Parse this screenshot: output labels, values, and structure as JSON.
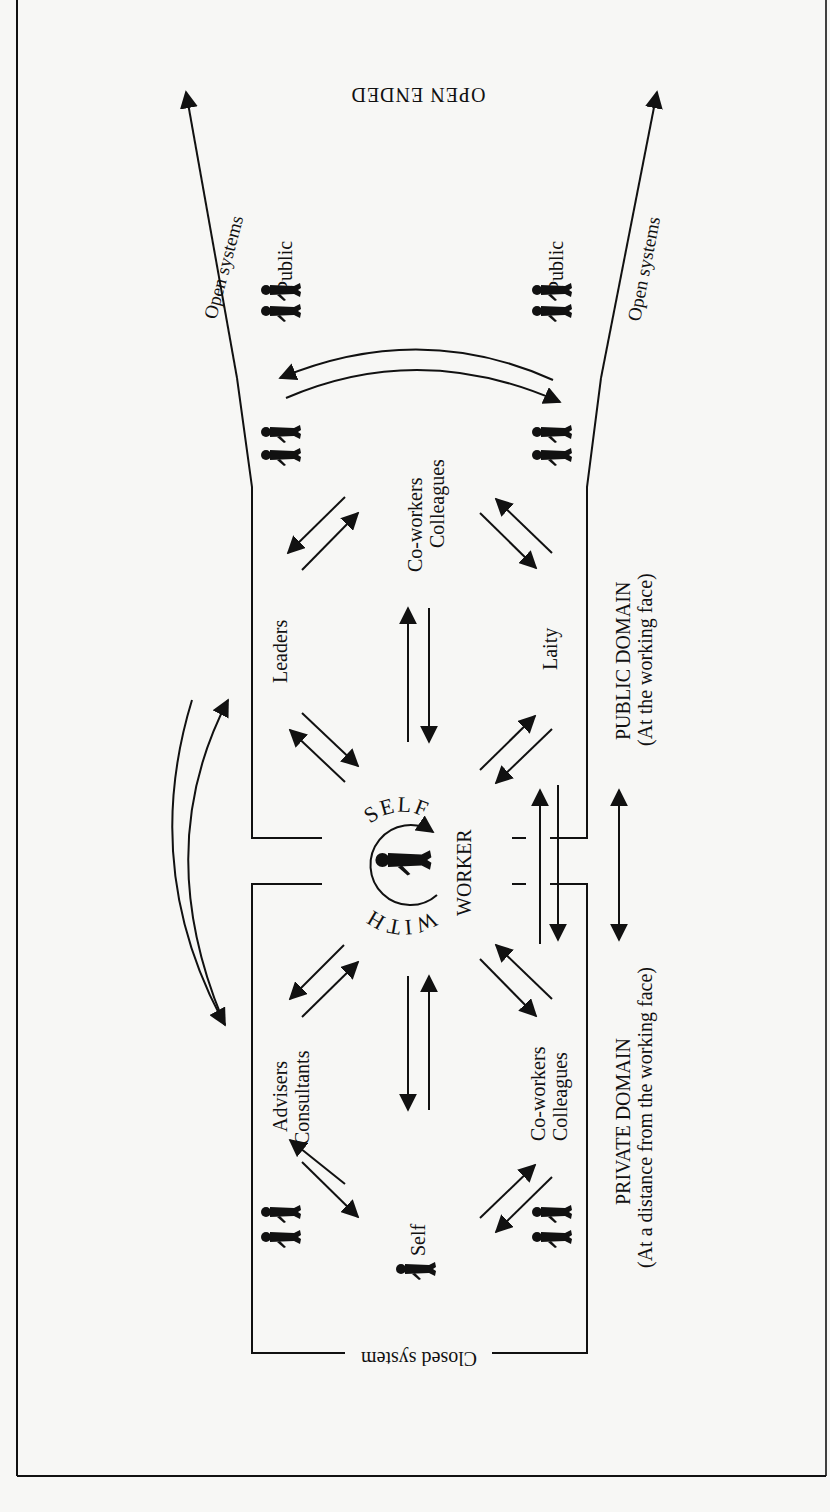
{
  "diagram": {
    "title_top": "OPEN ENDED",
    "closed_system_label": "Closed system",
    "center": {
      "arc_top": "SELF",
      "arc_bottom": "WITH",
      "side": "WORKER"
    },
    "open_systems_left": "Open systems",
    "open_systems_right": "Open systems",
    "groups": {
      "public_left": "Public",
      "public_right": "Public",
      "leaders": "Leaders",
      "coworkers_top_line1": "Co-workers",
      "coworkers_top_line2": "Colleagues",
      "laity": "Laity",
      "advisers_line1": "Advisers",
      "advisers_line2": "Consultants",
      "coworkers_bottom_line1": "Co-workers",
      "coworkers_bottom_line2": "Colleagues",
      "self": "Self"
    },
    "domains": {
      "public_line1": "PUBLIC DOMAIN",
      "public_line2": "(At the working face)",
      "private_line1": "PRIVATE DOMAIN",
      "private_line2": "(At a distance from the working face)"
    },
    "colors": {
      "ink": "#111111",
      "paper": "#f7f7f5"
    }
  }
}
